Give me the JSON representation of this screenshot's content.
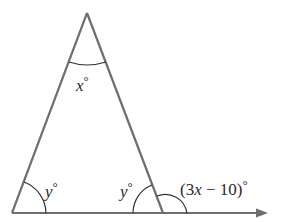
{
  "diagram": {
    "type": "triangle-with-exterior-angle",
    "stroke_color": "#6e6e6e",
    "arc_color": "#333333",
    "vertices": {
      "apex": [
        87,
        13
      ],
      "left_base": [
        12,
        213
      ],
      "right_base": [
        163,
        213
      ]
    },
    "baseline_arrow_tip": [
      268,
      213
    ],
    "labels": {
      "apex_var": "x",
      "apex_deg": "°",
      "left_var": "y",
      "left_deg": "°",
      "right_var": "y",
      "right_deg": "°",
      "exterior_open": "(3",
      "exterior_var": "x",
      "exterior_rest": " − 10)",
      "exterior_deg": "°"
    }
  }
}
